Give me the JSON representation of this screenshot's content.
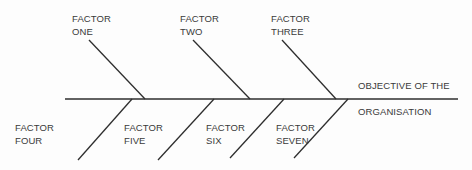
{
  "diagram": {
    "type": "fishbone",
    "objective": {
      "line1": "OBJECTIVE OF THE",
      "line2": "ORGANISATION"
    },
    "factors": [
      {
        "line1": "FACTOR",
        "line2": "ONE"
      },
      {
        "line1": "FACTOR",
        "line2": "TWO"
      },
      {
        "line1": "FACTOR",
        "line2": "THREE"
      },
      {
        "line1": "FACTOR",
        "line2": "FOUR"
      },
      {
        "line1": "FACTOR",
        "line2": "FIVE"
      },
      {
        "line1": "FACTOR",
        "line2": "SIX"
      },
      {
        "line1": "FACTOR",
        "line2": "SEVEN"
      }
    ],
    "line_color": "#2e2e2e"
  }
}
